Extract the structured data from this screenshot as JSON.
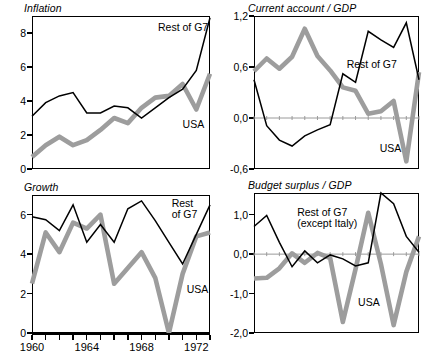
{
  "figure": {
    "x_axis": {
      "labels": [
        "1960",
        "1964",
        "1968",
        "1972"
      ],
      "label_years": [
        1960,
        1964,
        1968,
        1972
      ],
      "tick_years": [
        1960,
        1961,
        1962,
        1963,
        1964,
        1965,
        1966,
        1967,
        1968,
        1969,
        1970,
        1971,
        1972,
        1973
      ],
      "range": [
        1960,
        1973
      ]
    },
    "series_colors": {
      "rest_of_g7": "#000000",
      "usa": "#9d9d9d"
    }
  },
  "chart_data": [
    {
      "id": "inflation",
      "type": "line",
      "title": "Inflation",
      "xlabel": "",
      "ylabel": "",
      "xlim": [
        1960,
        1973
      ],
      "ylim": [
        0,
        9
      ],
      "yticks": [
        0,
        2,
        4,
        6,
        8
      ],
      "ytick_labels": [
        "0",
        "2",
        "4",
        "6",
        "8"
      ],
      "grid": false,
      "zero_line": false,
      "legend": "inline-annotations",
      "x": [
        1960,
        1961,
        1962,
        1963,
        1964,
        1965,
        1966,
        1967,
        1968,
        1969,
        1970,
        1971,
        1972,
        1973
      ],
      "series": [
        {
          "name": "Rest of G7",
          "color": "#000000",
          "style": "thin-black",
          "label_x": 1969.2,
          "label_y": 8.3,
          "values": [
            3.1,
            3.9,
            4.3,
            4.5,
            3.3,
            3.3,
            3.7,
            3.6,
            3.0,
            3.6,
            4.2,
            4.7,
            5.8,
            8.9
          ]
        },
        {
          "name": "USA",
          "color": "#9d9d9d",
          "style": "thick-gray",
          "label_x": 1971.0,
          "label_y": 2.6,
          "values": [
            0.7,
            1.4,
            1.9,
            1.4,
            1.7,
            2.3,
            3.0,
            2.7,
            3.6,
            4.2,
            4.3,
            5.0,
            3.5,
            5.6
          ]
        }
      ]
    },
    {
      "id": "current-account-gdp",
      "type": "line",
      "title": "Current account / GDP",
      "xlabel": "",
      "ylabel": "",
      "xlim": [
        1960,
        1973
      ],
      "ylim": [
        -0.6,
        1.2
      ],
      "yticks": [
        -0.6,
        0.0,
        0.6,
        1.2
      ],
      "ytick_labels": [
        "-0,6",
        "0,0",
        "0,6",
        "1,2"
      ],
      "grid": false,
      "zero_line": true,
      "legend": "inline-annotations",
      "x": [
        1960,
        1961,
        1962,
        1963,
        1964,
        1965,
        1966,
        1967,
        1968,
        1969,
        1970,
        1971,
        1972,
        1973
      ],
      "series": [
        {
          "name": "Rest of G7",
          "color": "#000000",
          "style": "thin-black",
          "label_x": 1967.3,
          "label_y": 0.62,
          "values": [
            0.45,
            -0.09,
            -0.26,
            -0.33,
            -0.21,
            -0.14,
            -0.08,
            0.52,
            0.42,
            1.02,
            0.92,
            0.83,
            1.12,
            0.45
          ]
        },
        {
          "name": "USA",
          "color": "#9d9d9d",
          "style": "thick-gray",
          "label_x": 1969.9,
          "label_y": -0.36,
          "values": [
            0.55,
            0.7,
            0.58,
            0.72,
            1.05,
            0.73,
            0.56,
            0.36,
            0.32,
            0.05,
            0.08,
            0.2,
            -0.51,
            0.54
          ]
        }
      ]
    },
    {
      "id": "growth",
      "type": "line",
      "title": "Growth",
      "xlabel": "",
      "ylabel": "",
      "xlim": [
        1960,
        1973
      ],
      "ylim": [
        0,
        7
      ],
      "yticks": [
        0,
        2,
        4,
        6
      ],
      "ytick_labels": [
        "0",
        "2",
        "4",
        "6"
      ],
      "grid": false,
      "zero_line": false,
      "legend": "inline-annotations",
      "x": [
        1960,
        1961,
        1962,
        1963,
        1964,
        1965,
        1966,
        1967,
        1968,
        1969,
        1970,
        1971,
        1972,
        1973
      ],
      "series": [
        {
          "name": "Rest of G7",
          "color": "#000000",
          "style": "thin-black",
          "label_x": 1970.2,
          "label_y": 6.55,
          "label_lines": [
            "Rest",
            "of G7"
          ],
          "values": [
            5.9,
            5.75,
            5.2,
            6.5,
            4.6,
            5.5,
            4.6,
            6.3,
            6.7,
            5.7,
            4.6,
            3.5,
            5.0,
            6.5
          ]
        },
        {
          "name": "USA",
          "color": "#9d9d9d",
          "style": "thick-gray",
          "label_x": 1971.3,
          "label_y": 2.2,
          "values": [
            2.5,
            5.1,
            4.1,
            5.6,
            5.3,
            6.0,
            2.5,
            3.3,
            4.1,
            2.8,
            0.0,
            3.0,
            4.9,
            5.1
          ]
        }
      ]
    },
    {
      "id": "budget-surplus-gdp",
      "type": "line",
      "title": "Budget surplus / GDP",
      "xlabel": "",
      "ylabel": "",
      "xlim": [
        1960,
        1973
      ],
      "ylim": [
        -2.0,
        1.55
      ],
      "yticks": [
        -2.0,
        -1.0,
        0.0,
        1.0
      ],
      "ytick_labels": [
        "-2,0",
        "-1,0",
        "0,0",
        "1,0"
      ],
      "grid": false,
      "zero_line": true,
      "legend": "inline-annotations",
      "x": [
        1960,
        1961,
        1962,
        1963,
        1964,
        1965,
        1966,
        1967,
        1968,
        1969,
        1970,
        1971,
        1972,
        1973
      ],
      "series": [
        {
          "name": "Rest of G7 (except Italy)",
          "color": "#000000",
          "style": "thin-black",
          "label_x": 1963.4,
          "label_y": 1.05,
          "label_lines": [
            "Rest of G7",
            "(except Italy)"
          ],
          "values": [
            0.7,
            0.98,
            0.3,
            -0.32,
            0.08,
            -0.22,
            -0.02,
            -0.12,
            -0.3,
            -0.22,
            1.55,
            1.28,
            0.45,
            0.05
          ]
        },
        {
          "name": "USA",
          "color": "#9d9d9d",
          "style": "thick-gray",
          "label_x": 1968.2,
          "label_y": -1.25,
          "values": [
            -0.62,
            -0.6,
            -0.36,
            0.02,
            -0.22,
            0.03,
            -0.1,
            -1.72,
            -0.38,
            1.05,
            -0.25,
            -1.8,
            -0.45,
            0.45
          ]
        }
      ]
    }
  ]
}
